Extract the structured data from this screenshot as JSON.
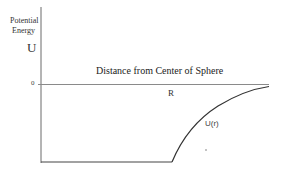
{
  "diagram": {
    "y_axis": {
      "label_line1": "Potential",
      "label_line2": "Energy",
      "symbol": "U",
      "zero_tick": "0"
    },
    "x_axis": {
      "label": "Distance from Center of Sphere",
      "marker": "R"
    },
    "curve": {
      "label": "U(r)",
      "description": "Constant (flat, negative) inside sphere up to r = R, then rises toward 0 outside sphere"
    },
    "colors": {
      "line": "#555555",
      "curve": "#333333",
      "text": "#222222",
      "background": "#ffffff"
    }
  }
}
